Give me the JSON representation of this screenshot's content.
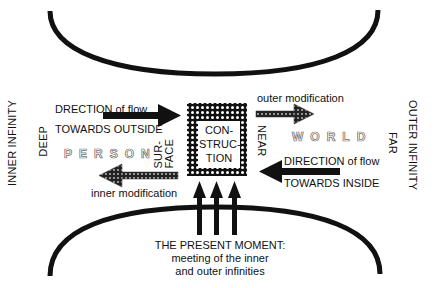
{
  "diagram": {
    "left_axis_labels": {
      "outer": "INNER INFINITY",
      "inner": "DEEP"
    },
    "right_axis_labels": {
      "outer": "OUTER INFINITY",
      "inner": "FAR"
    },
    "center_box": {
      "lines": [
        "CON-",
        "STRUC-",
        "TION"
      ]
    },
    "left_side": {
      "flow_top": "DRECTION of flow",
      "flow_bottom": "TOWARDS OUTSIDE",
      "region_label": "PERSON",
      "boundary_label_lines": [
        "SUR-",
        "FACE"
      ],
      "modification_label": "inner modification"
    },
    "right_side": {
      "modification_label": "outer modification",
      "region_label": "WORLD",
      "boundary_label": "NEAR",
      "flow_top": "DIRECTION of flow",
      "flow_bottom": "TOWARDS INSIDE"
    },
    "bottom_caption": {
      "title": "THE PRESENT MOMENT:",
      "line2": "meeting of the inner",
      "line3": "and outer infinities"
    },
    "colors": {
      "ink": "#111111",
      "background": "#ffffff",
      "outline_text": "#777777"
    }
  }
}
